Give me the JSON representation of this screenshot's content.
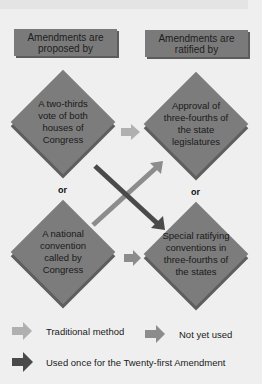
{
  "headers": {
    "proposed": "Amendments are proposed by",
    "ratified": "Amendments are ratified by"
  },
  "proposal_methods": [
    {
      "label": "A two-thirds vote of both houses of Congress"
    },
    {
      "label": "A national convention called by Congress"
    }
  ],
  "ratification_methods": [
    {
      "label": "Approval of three-fourths of the state legislatures"
    },
    {
      "label": "Special ratifying conventions in three-fourths of the states"
    }
  ],
  "separators": {
    "left": "or",
    "right": "or"
  },
  "legend": {
    "traditional": "Traditional method",
    "not_used": "Not yet used",
    "used_once": "Used once for the Twenty-first Amendment"
  },
  "colors": {
    "background": "#efefef",
    "box": "#7a7a7a",
    "traditional_arrow": "#b0b0b0",
    "not_used_arrow": "#8c8c8c",
    "used_once_arrow": "#4a4a4a"
  }
}
